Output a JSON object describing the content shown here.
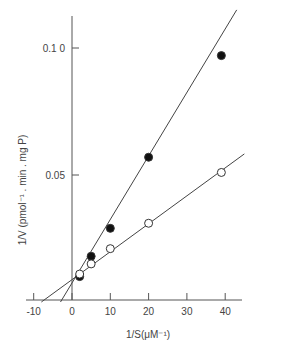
{
  "chart_data": {
    "type": "scatter",
    "title": "",
    "xlabel": "1/S(μM⁻¹)",
    "ylabel": "1/V (pmol⁻¹ . min . mg P)",
    "xlim": [
      -12,
      45
    ],
    "ylim": [
      0,
      0.115
    ],
    "x_ticks": [
      -10,
      0,
      10,
      20,
      30,
      40
    ],
    "x_tick_labels": [
      "-10",
      "0",
      "10",
      "20",
      "30",
      "40"
    ],
    "y_ticks": [
      0.05,
      0.1
    ],
    "y_tick_labels": [
      "0.05",
      "0.1 0"
    ],
    "grid": false,
    "legend": null,
    "series": [
      {
        "name": "filled circles",
        "marker": "filled-circle",
        "x": [
          2,
          5,
          10,
          20,
          39
        ],
        "y": [
          0.01,
          0.018,
          0.029,
          0.057,
          0.097
        ],
        "fit_line": {
          "x_intercept": -3,
          "y_intercept": 0.0075,
          "x_end": 43
        }
      },
      {
        "name": "open circles",
        "marker": "open-circle",
        "x": [
          2,
          5,
          10,
          20,
          39
        ],
        "y": [
          0.011,
          0.015,
          0.021,
          0.031,
          0.051
        ],
        "fit_line": {
          "x_intercept": -8,
          "y_intercept": 0.0088,
          "x_end": 45
        }
      }
    ]
  }
}
